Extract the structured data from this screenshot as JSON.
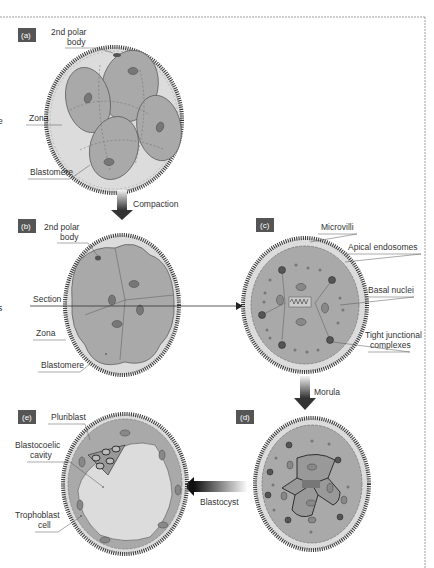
{
  "figure": {
    "panels": {
      "a": {
        "tag": "(a)",
        "labels": {
          "polar_body_1": "2nd polar",
          "polar_body_2": "body",
          "zona": "Zona",
          "blastomere": "Blastomere"
        }
      },
      "b": {
        "tag": "(b)",
        "labels": {
          "polar_body_1": "2nd polar",
          "polar_body_2": "body",
          "section": "Section",
          "zona": "Zona",
          "blastomere": "Blastomere"
        }
      },
      "c": {
        "tag": "(c)",
        "labels": {
          "microvilli": "Microvilli",
          "apical": "Apical endosomes",
          "basal": "Basal nuclei",
          "tight_1": "Tight junctional",
          "tight_2": "complexes"
        }
      },
      "d": {
        "tag": "(d)"
      },
      "e": {
        "tag": "(e)",
        "labels": {
          "pluriblast": "Pluriblast",
          "cavity_1": "Blastocoelic",
          "cavity_2": "cavity",
          "troph_1": "Trophoblast",
          "troph_2": "cell"
        }
      }
    },
    "arrows": {
      "compaction": "Compaction",
      "morula": "Morula",
      "blastocyst": "Blastocyst"
    },
    "edge_fragments": {
      "left_top": "e",
      "left_mid": "s"
    },
    "colors": {
      "zona": "#3a3a3a",
      "cell_fill": "#a9a9a9",
      "cytoplasm": "#d6d6d6",
      "nucleus": "#7a7a7a",
      "tag_bg": "#555555",
      "cavity": "#dcdcdc"
    }
  }
}
